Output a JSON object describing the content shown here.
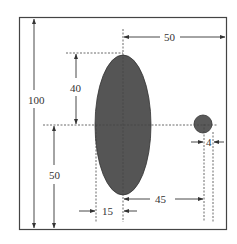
{
  "diagram": {
    "type": "dimensioned-drawing",
    "shapes": [
      {
        "kind": "ellipse",
        "name": "large-ellipse",
        "fill": "#555555",
        "semi_major_label": "40",
        "semi_minor_label": "15"
      },
      {
        "kind": "circle",
        "name": "small-circle",
        "fill": "#5a5a5a",
        "diameter_label": "4"
      }
    ],
    "dimensions": {
      "total_height": "100",
      "ellipse_center_to_right_edge": "50",
      "ellipse_center_to_top": "40",
      "ellipse_center_height_from_bottom": "50",
      "ellipse_half_width": "15",
      "ellipse_center_to_circle_center": "45",
      "circle_diameter": "4"
    },
    "colors": {
      "border": "#333333",
      "fill_dark": "#555555",
      "dash": "#444444"
    }
  }
}
